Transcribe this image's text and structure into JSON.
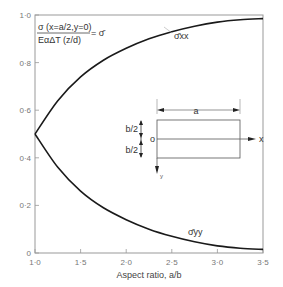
{
  "chart_data": {
    "type": "line",
    "title": "",
    "xlabel": "Aspect ratio, a/b",
    "ylabel": "",
    "xlim": [
      1.0,
      3.5
    ],
    "ylim": [
      0,
      1.0
    ],
    "grid": false,
    "x_ticks": [
      "1·0",
      "1·5",
      "2·0",
      "2·5",
      "3·0",
      "3·5"
    ],
    "y_ticks": [
      "0",
      "0·2",
      "0·4",
      "0·6",
      "0·8",
      "1·0"
    ],
    "x": [
      1.0,
      1.25,
      1.5,
      1.75,
      2.0,
      2.25,
      2.5,
      2.75,
      3.0,
      3.25,
      3.5
    ],
    "series": [
      {
        "name": "σ̄xx",
        "values": [
          0.5,
          0.64,
          0.74,
          0.81,
          0.86,
          0.9,
          0.93,
          0.953,
          0.97,
          0.98,
          0.985
        ]
      },
      {
        "name": "σ̄yy",
        "values": [
          0.5,
          0.36,
          0.26,
          0.19,
          0.14,
          0.1,
          0.07,
          0.047,
          0.03,
          0.02,
          0.015
        ]
      }
    ],
    "annotations": {
      "formula_numerator": "σ (x=a/2,y=0)",
      "formula_denominator": "EαΔT (z/d)",
      "formula_result": "= σ̄",
      "curve_label_top": "σ̄xx",
      "curve_label_bottom": "σ̄yy"
    },
    "inset": {
      "width_label": "a",
      "half_height_top": "b/2",
      "half_height_bottom": "b/2",
      "origin_label": "o",
      "x_axis_label": "x",
      "y_axis_label": "y"
    }
  }
}
